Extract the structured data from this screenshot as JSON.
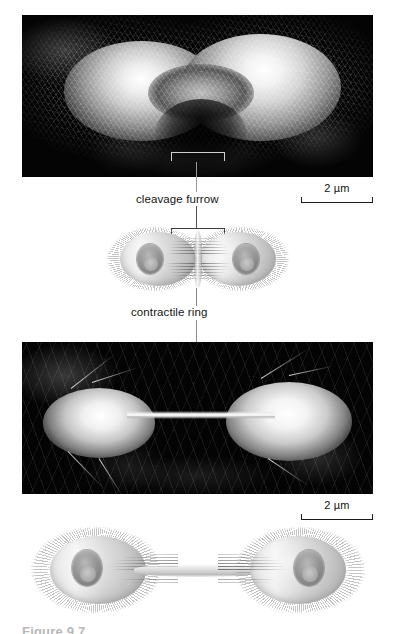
{
  "figure": {
    "domain": "textbook-figure",
    "background_color": "#ffffff"
  },
  "panels": [
    {
      "id": "top-micrograph",
      "type": "scanning-electron-micrograph",
      "description": "Dividing cell covered in microvilli showing an early cleavage furrow constriction at the equator",
      "background_color": "#040404"
    },
    {
      "id": "middle-illustration",
      "type": "illustration",
      "description": "Cutaway drawing of a dumbbell-shaped dividing cell with two nuclei and a contractile ring of microfilaments at the furrow"
    },
    {
      "id": "lower-micrograph",
      "type": "scanning-electron-micrograph",
      "description": "Two nearly separated daughter cells joined by a thin cytoplasmic bridge",
      "background_color": "#040404"
    },
    {
      "id": "bottom-illustration",
      "type": "illustration",
      "description": "Cutaway drawing of two daughter cells connected by a narrow midbody bridge containing microfilament bundles"
    }
  ],
  "labels": [
    {
      "id": "cleavage-furrow",
      "text": "cleavage furrow"
    },
    {
      "id": "contractile-ring",
      "text": "contractile ring"
    }
  ],
  "scale_bars": [
    {
      "id": "scale-bar-top",
      "text": "2 µm",
      "value": 2,
      "unit": "µm",
      "panel": "top-micrograph"
    },
    {
      "id": "scale-bar-lower",
      "text": "2 µm",
      "value": 2,
      "unit": "µm",
      "panel": "lower-micrograph"
    }
  ],
  "caption": {
    "text": "Figure 9.7",
    "note": "clipped at bottom edge of page"
  },
  "colors": {
    "micrograph_background": "#040404",
    "label_text": "#141414",
    "leader_line": "#4f4f4f",
    "bracket_light": "#cfcfcf",
    "bracket_dark": "#3d3d3d",
    "page_background": "#ffffff"
  }
}
